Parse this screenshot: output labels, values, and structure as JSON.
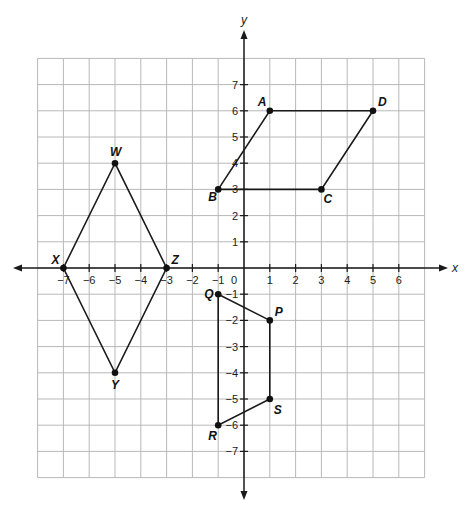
{
  "plane": {
    "origin_px": [
      244,
      268
    ],
    "unit_x_px": 25.8,
    "unit_y_px": 26.2,
    "grid_x_range": [
      -8,
      7
    ],
    "grid_y_range": [
      -8,
      8
    ],
    "x_axis_label": "x",
    "y_axis_label": "y",
    "x_tick_labels": [
      "−7",
      "−6",
      "−5",
      "−4",
      "−3",
      "−2",
      "−1",
      "0",
      "1",
      "2",
      "3",
      "4",
      "5",
      "6"
    ],
    "x_tick_values": [
      -7,
      -6,
      -5,
      -4,
      -3,
      -2,
      -1,
      0,
      1,
      2,
      3,
      4,
      5,
      6
    ],
    "y_tick_labels": [
      "7",
      "6",
      "5",
      "4",
      "3",
      "2",
      "1",
      "−1",
      "−2",
      "−3",
      "−4",
      "−5",
      "−6",
      "−7"
    ],
    "y_tick_values": [
      7,
      6,
      5,
      4,
      3,
      2,
      1,
      -1,
      -2,
      -3,
      -4,
      -5,
      -6,
      -7
    ],
    "colors": {
      "grid": "#b8b8b8",
      "axis": "#1a1a1a",
      "shape": "#1a1a1a"
    }
  },
  "shapes": [
    {
      "name": "parallelogram-abcd",
      "vertices": [
        {
          "label": "A",
          "x": 1,
          "y": 6,
          "label_dx": -12,
          "label_dy": -5
        },
        {
          "label": "D",
          "x": 5,
          "y": 6,
          "label_dx": 5,
          "label_dy": -5
        },
        {
          "label": "C",
          "x": 3,
          "y": 3,
          "label_dx": 2,
          "label_dy": 14
        },
        {
          "label": "B",
          "x": -1,
          "y": 3,
          "label_dx": -10,
          "label_dy": 12
        }
      ]
    },
    {
      "name": "rhombus-wxyz",
      "vertices": [
        {
          "label": "W",
          "x": -5,
          "y": 4,
          "label_dx": -5,
          "label_dy": -7
        },
        {
          "label": "Z",
          "x": -3,
          "y": 0,
          "label_dx": 5,
          "label_dy": -4
        },
        {
          "label": "Y",
          "x": -5,
          "y": -4,
          "label_dx": -4,
          "label_dy": 16
        },
        {
          "label": "X",
          "x": -7,
          "y": 0,
          "label_dx": -12,
          "label_dy": -4
        }
      ]
    },
    {
      "name": "quadrilateral-qpsr",
      "vertices": [
        {
          "label": "Q",
          "x": -1,
          "y": -1,
          "label_dx": -14,
          "label_dy": 4
        },
        {
          "label": "P",
          "x": 1,
          "y": -2,
          "label_dx": 5,
          "label_dy": -4
        },
        {
          "label": "S",
          "x": 1,
          "y": -5,
          "label_dx": 4,
          "label_dy": 15
        },
        {
          "label": "R",
          "x": -1,
          "y": -6,
          "label_dx": -10,
          "label_dy": 15
        }
      ]
    }
  ]
}
